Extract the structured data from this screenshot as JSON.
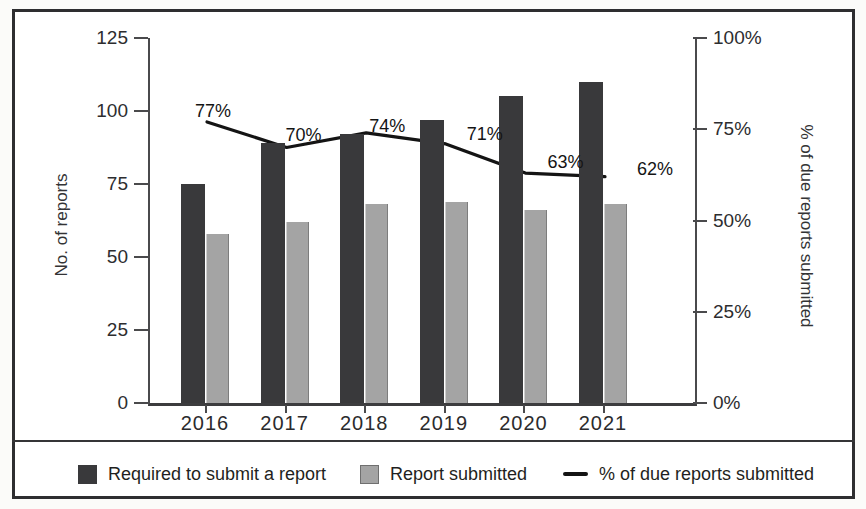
{
  "figure": {
    "kind": "scanned printed chart",
    "background_color": "#ffffff",
    "frame_border_color": "#2e2e30",
    "bar_dark_color": "#39393b",
    "bar_gray_color": "#a4a4a4",
    "line_color": "#141414"
  },
  "left_axis": {
    "title": "No. of reports",
    "tick_labels": [
      "125",
      "100",
      "75",
      "50",
      "25",
      "0"
    ]
  },
  "right_axis": {
    "title": "% of due reports submitted",
    "tick_labels": [
      "100%",
      "75%",
      "50%",
      "25%",
      "0%"
    ]
  },
  "x_axis": {
    "tick_labels": [
      "2016",
      "2017",
      "2018",
      "2019",
      "2020",
      "2021"
    ]
  },
  "legend": {
    "items": [
      {
        "swatch": "dark-square",
        "color": "#39393b",
        "label": "Required to submit a report"
      },
      {
        "swatch": "gray-square",
        "color": "#a4a4a4",
        "label": "Report submitted"
      },
      {
        "swatch": "line",
        "color": "#141414",
        "label": "% of due reports submitted"
      }
    ]
  },
  "chart_data": {
    "type": "bar",
    "subtype": "grouped-bar-with-line",
    "categories": [
      "2016",
      "2017",
      "2018",
      "2019",
      "2020",
      "2021"
    ],
    "series": [
      {
        "name": "Required to submit a report",
        "type": "bar",
        "axis": "left",
        "color": "#39393b",
        "values": [
          75,
          89,
          92,
          97,
          105,
          110
        ]
      },
      {
        "name": "Report submitted",
        "type": "bar",
        "axis": "left",
        "color": "#a4a4a4",
        "values": [
          58,
          62,
          68,
          69,
          66,
          68
        ]
      },
      {
        "name": "% of due reports submitted",
        "type": "line",
        "axis": "right",
        "color": "#141414",
        "values": [
          77,
          70,
          74,
          71,
          63,
          62
        ],
        "point_labels": [
          "77%",
          "70%",
          "74%",
          "71%",
          "63%",
          "62%"
        ]
      }
    ],
    "title": "",
    "xlabel": "",
    "ylabel": "No. of reports",
    "ylabel_right": "% of due reports submitted",
    "ylim_left": [
      0,
      125
    ],
    "ylim_right": [
      0,
      100
    ],
    "grid": false,
    "legend_position": "bottom"
  }
}
